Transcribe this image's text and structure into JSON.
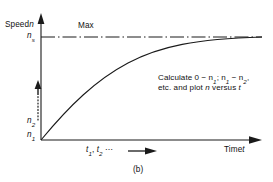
{
  "figure": {
    "caption": "(b)",
    "background_color": "#ffffff",
    "line_color": "#1a1a1a"
  },
  "axes": {
    "y_axis_label": "Speed n",
    "y_axis_label_plain": "Speed",
    "y_axis_symbol": "n",
    "x_axis_label_plain": "Time",
    "x_axis_symbol": "t",
    "x_axis_label": "Time t",
    "x_tick_note": "t1, t2 ⋯"
  },
  "y_ticks": [
    {
      "id": "ns",
      "base": "n",
      "sub": "s",
      "value_note": "maximum / synchronous speed"
    },
    {
      "id": "n2",
      "base": "n",
      "sub": "2",
      "value_note": "second speed sample"
    },
    {
      "id": "n1",
      "base": "n",
      "sub": "1",
      "value_note": "first speed sample"
    }
  ],
  "annotations": {
    "max_line_label": "Max",
    "note_line1_prefix": "Calculate 0 − ",
    "note_line1": "Calculate 0 − n1; n1 − n2,",
    "note_line2": "etc. and plot n versus t"
  },
  "chart_data": {
    "type": "line",
    "title": "",
    "subtitle": "",
    "xlabel": "Time t",
    "ylabel": "Speed n",
    "xlim": [
      0,
      1
    ],
    "ylim": [
      0,
      1.12
    ],
    "grid": false,
    "legend": null,
    "x_tick_labels": [
      "t1, t2 ⋯"
    ],
    "y_tick_labels": [
      "n1",
      "n2",
      "ns"
    ],
    "y_tick_values": [
      0.0,
      0.12,
      1.0
    ],
    "series": [
      {
        "name": "speed build-up curve",
        "style": "solid",
        "x": [
          0.0,
          0.04,
          0.08,
          0.12,
          0.16,
          0.2,
          0.25,
          0.3,
          0.35,
          0.4,
          0.46,
          0.52,
          0.58,
          0.64,
          0.7,
          0.76,
          0.82,
          0.88,
          0.94,
          1.0
        ],
        "y": [
          0.0,
          0.12,
          0.23,
          0.32,
          0.4,
          0.47,
          0.55,
          0.62,
          0.68,
          0.73,
          0.79,
          0.83,
          0.87,
          0.9,
          0.93,
          0.95,
          0.97,
          0.98,
          0.99,
          1.0
        ]
      },
      {
        "name": "Max asymptote",
        "style": "dash-dot",
        "x": [
          0.0,
          1.0
        ],
        "y": [
          1.0,
          1.0
        ]
      }
    ],
    "annotations": [
      {
        "text": "Max",
        "x": 0.17,
        "y": 1.06
      },
      {
        "text": "Calculate 0 − n1; n1 − n2, etc. and plot n versus t",
        "x": 0.54,
        "y": 0.6
      }
    ]
  }
}
